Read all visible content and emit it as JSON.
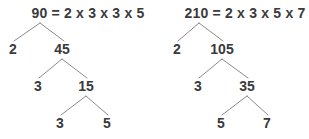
{
  "figure": {
    "title": "",
    "background_color": "#ffffff",
    "text_color": "#3a3a3c",
    "line_color": "#8a8a8e"
  },
  "trees": [
    {
      "id": "factor-tree-90",
      "equation": "90 = 2 x 3 x 3 x 5",
      "equation_x": 88,
      "equation_y": 6,
      "nodes": [
        {
          "label": "90",
          "x": 40,
          "y": 6,
          "level": 0,
          "hidden": true
        },
        {
          "label": "2",
          "x": 13,
          "y": 42,
          "level": 1
        },
        {
          "label": "45",
          "x": 62,
          "y": 42,
          "level": 1
        },
        {
          "label": "3",
          "x": 38,
          "y": 79,
          "level": 2
        },
        {
          "label": "15",
          "x": 86,
          "y": 79,
          "level": 2
        },
        {
          "label": "3",
          "x": 60,
          "y": 116,
          "level": 3
        },
        {
          "label": "5",
          "x": 107,
          "y": 116,
          "level": 3
        }
      ],
      "edges": [
        {
          "x1": 40,
          "y1": 23,
          "x2": 14,
          "y2": 41
        },
        {
          "x1": 40,
          "y1": 23,
          "x2": 64,
          "y2": 41
        },
        {
          "x1": 62,
          "y1": 59,
          "x2": 39,
          "y2": 78
        },
        {
          "x1": 62,
          "y1": 59,
          "x2": 87,
          "y2": 78
        },
        {
          "x1": 86,
          "y1": 96,
          "x2": 61,
          "y2": 115
        },
        {
          "x1": 86,
          "y1": 96,
          "x2": 108,
          "y2": 115
        }
      ]
    },
    {
      "id": "factor-tree-210",
      "equation": "210 = 2 x 3 x 5 x 7",
      "equation_x": 245,
      "equation_y": 6,
      "nodes": [
        {
          "label": "210",
          "x": 199,
          "y": 6,
          "level": 0,
          "hidden": true
        },
        {
          "label": "2",
          "x": 177,
          "y": 42,
          "level": 1
        },
        {
          "label": "105",
          "x": 222,
          "y": 42,
          "level": 1
        },
        {
          "label": "3",
          "x": 198,
          "y": 79,
          "level": 2
        },
        {
          "label": "35",
          "x": 247,
          "y": 79,
          "level": 2
        },
        {
          "label": "5",
          "x": 221,
          "y": 116,
          "level": 3
        },
        {
          "label": "7",
          "x": 267,
          "y": 116,
          "level": 3
        }
      ],
      "edges": [
        {
          "x1": 199,
          "y1": 23,
          "x2": 178,
          "y2": 41
        },
        {
          "x1": 199,
          "y1": 23,
          "x2": 223,
          "y2": 41
        },
        {
          "x1": 222,
          "y1": 59,
          "x2": 199,
          "y2": 78
        },
        {
          "x1": 222,
          "y1": 59,
          "x2": 248,
          "y2": 78
        },
        {
          "x1": 247,
          "y1": 96,
          "x2": 222,
          "y2": 115
        },
        {
          "x1": 247,
          "y1": 96,
          "x2": 268,
          "y2": 115
        }
      ]
    }
  ]
}
